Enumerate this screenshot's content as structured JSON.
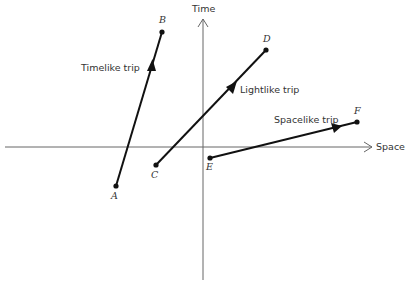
{
  "diagram": {
    "type": "spacetime-diagram",
    "axes": {
      "time_label": "Time",
      "space_label": "Space"
    },
    "trips": [
      {
        "name": "Timelike trip",
        "from": "A",
        "to": "B"
      },
      {
        "name": "Lightlike trip",
        "from": "C",
        "to": "D"
      },
      {
        "name": "Spacelike trip",
        "from": "E",
        "to": "F"
      }
    ],
    "points": {
      "A": "A",
      "B": "B",
      "C": "C",
      "D": "D",
      "E": "E",
      "F": "F"
    },
    "colors": {
      "axis": "#666666",
      "line": "#111111",
      "text": "#333333"
    }
  }
}
